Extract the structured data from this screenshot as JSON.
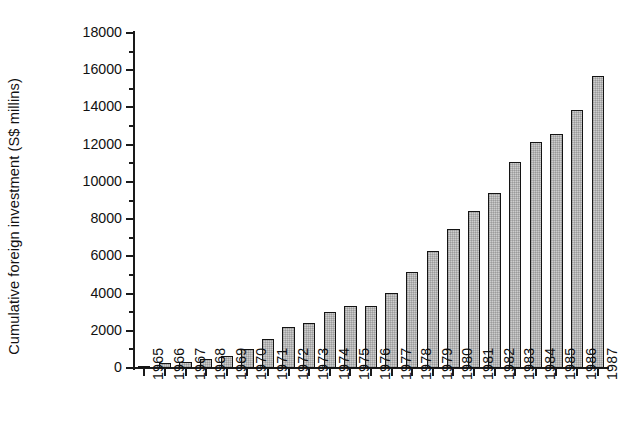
{
  "chart_data": {
    "type": "bar",
    "title": "",
    "xlabel": "",
    "ylabel": "Cumulative foreign investment (S$ millins)",
    "ylim": [
      0,
      18000
    ],
    "ytick_step": 2000,
    "yminor_step": 1000,
    "grid": false,
    "legend": null,
    "bar_color": "#cdcdcd",
    "bar_edge_color": "#141414",
    "axis_color": "#1a1a1a",
    "categories": [
      "1965",
      "1966",
      "1967",
      "1968",
      "1969",
      "1970",
      "1971",
      "1972",
      "1973",
      "1974",
      "1975",
      "1976",
      "1977",
      "1978",
      "1979",
      "1980",
      "1981",
      "1982",
      "1983",
      "1984",
      "1985",
      "1986",
      "1987"
    ],
    "values": [
      100,
      270,
      350,
      470,
      620,
      1000,
      1540,
      2180,
      2400,
      3000,
      3350,
      3350,
      4050,
      5150,
      6300,
      7450,
      8450,
      9400,
      11050,
      12150,
      12600,
      13850,
      15700
    ],
    "ytick_labels": [
      "0",
      "2000",
      "4000",
      "6000",
      "8000",
      "10000",
      "12000",
      "14000",
      "16000",
      "18000"
    ],
    "ytick_values": [
      0,
      2000,
      4000,
      6000,
      8000,
      10000,
      12000,
      14000,
      16000,
      18000
    ]
  }
}
